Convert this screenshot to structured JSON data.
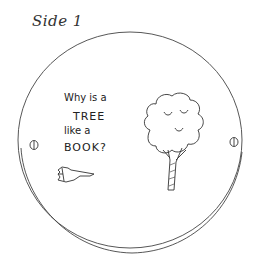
{
  "title": "Side 1",
  "question": {
    "line1": "Why is a",
    "line2": "TREE",
    "line3": "like a",
    "line4": "BOOK?"
  },
  "icons": {
    "pointer": "pointing-hand-icon",
    "tree": "tree-icon",
    "holes": [
      "hole-left",
      "hole-right"
    ]
  },
  "colors": {
    "ink": "#333333",
    "background": "#ffffff"
  }
}
